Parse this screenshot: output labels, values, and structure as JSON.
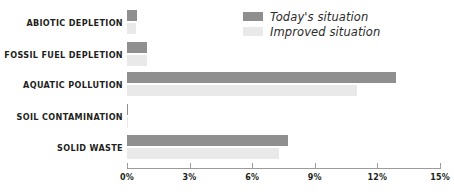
{
  "chart_data": {
    "type": "bar",
    "orientation": "horizontal",
    "title": "",
    "subtitle": "",
    "xlabel": "",
    "ylabel": "",
    "xlim": [
      0,
      15
    ],
    "xtick_labels": [
      "0%",
      "3%",
      "6%",
      "9%",
      "12%",
      "15%"
    ],
    "xtick_values": [
      0,
      3,
      6,
      9,
      12,
      15
    ],
    "grid": false,
    "legend_position": "top-right",
    "categories": [
      "ABIOTIC DEPLETION",
      "FOSSIL FUEL DEPLETION",
      "AQUATIC POLLUTION",
      "SOIL CONTAMINATION",
      "SOLID WASTE"
    ],
    "series": [
      {
        "name": "Today's situation",
        "color": "#8f8f8f",
        "values": [
          0.5,
          0.95,
          12.9,
          0.05,
          7.7
        ]
      },
      {
        "name": "Improved situation",
        "color": "#e9e9e9",
        "values": [
          0.45,
          0.95,
          11.0,
          0.05,
          7.3
        ]
      }
    ]
  },
  "legend": {
    "items": [
      {
        "label": "Today's situation",
        "color": "#8f8f8f"
      },
      {
        "label": "Improved situation",
        "color": "#e9e9e9"
      }
    ]
  },
  "axis": {
    "line_color": "#9b9b9b"
  }
}
